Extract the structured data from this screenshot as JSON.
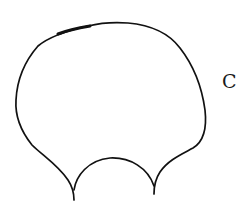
{
  "figure": {
    "panel_label": "C",
    "stroke_color": "#111111",
    "background": "#ffffff"
  }
}
